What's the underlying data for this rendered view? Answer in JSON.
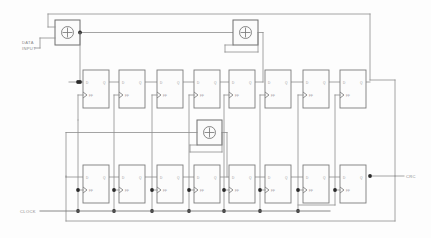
{
  "diagram": {
    "type": "logic-schematic",
    "canvas": {
      "width": 431,
      "height": 238,
      "background": "#fdfdfd"
    },
    "colors": {
      "wire": "#8d8d8d",
      "block_outline": "#7c7c7c",
      "junction": "#2b2b2b",
      "label_text": "#8a8a8a",
      "pin_text": "#9a9a9a",
      "background": "#fdfdfd"
    }
  },
  "ports": {
    "data_input": {
      "label_line1": "DATA",
      "label_line2": "INPUT",
      "x": 22,
      "y": 45
    },
    "clock": {
      "label": "CLOCK",
      "x": 22,
      "y": 211
    },
    "crc_output": {
      "label": "CRC",
      "x": 404,
      "y": 176
    }
  },
  "pins": {
    "d": "D",
    "q": "Q",
    "ff": "FF"
  },
  "xor_gates": [
    {
      "id": "xor-input",
      "symbol": "+",
      "x": 55,
      "y": 20,
      "w": 25,
      "h": 25
    },
    {
      "id": "xor-top-tap",
      "symbol": "+",
      "x": 233,
      "y": 20,
      "w": 25,
      "h": 25
    },
    {
      "id": "xor-mid-tap",
      "symbol": "+",
      "x": 197,
      "y": 120,
      "w": 25,
      "h": 25
    }
  ],
  "flipflops_top": [
    {
      "id": "ff-t1",
      "x": 83,
      "y": 70,
      "w": 26,
      "h": 38,
      "d": "D",
      "q": "Q",
      "ff": "FF"
    },
    {
      "id": "ff-t2",
      "x": 119,
      "y": 70,
      "w": 26,
      "h": 38,
      "d": "D",
      "q": "Q",
      "ff": "FF"
    },
    {
      "id": "ff-t3",
      "x": 157,
      "y": 70,
      "w": 26,
      "h": 38,
      "d": "D",
      "q": "Q",
      "ff": "FF"
    },
    {
      "id": "ff-t4",
      "x": 194,
      "y": 70,
      "w": 26,
      "h": 38,
      "d": "D",
      "q": "Q",
      "ff": "FF"
    },
    {
      "id": "ff-t5",
      "x": 229,
      "y": 70,
      "w": 26,
      "h": 38,
      "d": "D",
      "q": "Q",
      "ff": "FF"
    },
    {
      "id": "ff-t6",
      "x": 265,
      "y": 70,
      "w": 26,
      "h": 38,
      "d": "D",
      "q": "Q",
      "ff": "FF"
    },
    {
      "id": "ff-t7",
      "x": 303,
      "y": 70,
      "w": 26,
      "h": 38,
      "d": "D",
      "q": "Q",
      "ff": "FF"
    },
    {
      "id": "ff-t8",
      "x": 340,
      "y": 70,
      "w": 26,
      "h": 38,
      "d": "D",
      "q": "Q",
      "ff": "FF"
    }
  ],
  "flipflops_bottom": [
    {
      "id": "ff-b1",
      "x": 83,
      "y": 165,
      "w": 26,
      "h": 38,
      "d": "D",
      "q": "Q",
      "ff": "FF"
    },
    {
      "id": "ff-b2",
      "x": 119,
      "y": 165,
      "w": 26,
      "h": 38,
      "d": "D",
      "q": "Q",
      "ff": "FF"
    },
    {
      "id": "ff-b3",
      "x": 157,
      "y": 165,
      "w": 26,
      "h": 38,
      "d": "D",
      "q": "Q",
      "ff": "FF"
    },
    {
      "id": "ff-b4",
      "x": 194,
      "y": 165,
      "w": 26,
      "h": 38,
      "d": "D",
      "q": "Q",
      "ff": "FF"
    },
    {
      "id": "ff-b5",
      "x": 229,
      "y": 165,
      "w": 26,
      "h": 38,
      "d": "D",
      "q": "Q",
      "ff": "FF"
    },
    {
      "id": "ff-b6",
      "x": 265,
      "y": 165,
      "w": 26,
      "h": 38,
      "d": "D",
      "q": "Q",
      "ff": "FF"
    },
    {
      "id": "ff-b7",
      "x": 303,
      "y": 165,
      "w": 26,
      "h": 38,
      "d": "D",
      "q": "Q",
      "ff": "FF"
    },
    {
      "id": "ff-b8",
      "x": 340,
      "y": 165,
      "w": 26,
      "h": 38,
      "d": "D",
      "q": "Q",
      "ff": "FF"
    }
  ],
  "counts": {
    "top_row_flipflops": 8,
    "bottom_row_flipflops": 8,
    "xor_gates": 3,
    "total_flipflops": 16
  }
}
